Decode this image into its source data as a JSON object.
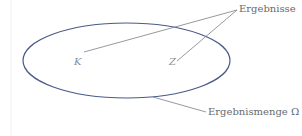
{
  "diagram": {
    "type": "set-diagram",
    "set": {
      "label": "Ergebnismenge Ω",
      "shape": "ellipse",
      "stroke_color": "#4a5a8a"
    },
    "elements": [
      {
        "label": "K"
      },
      {
        "label": "Z"
      }
    ],
    "annotation": {
      "label": "Ergebnisse"
    },
    "pointer_color": "#7a7f86",
    "margin_line_color": "#eeeeee"
  }
}
